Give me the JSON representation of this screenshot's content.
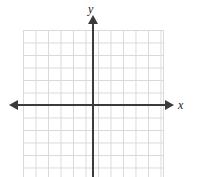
{
  "figure": {
    "title": "",
    "type": "blank-cartesian-coordinate-plane",
    "background_color": "#ffffff"
  },
  "axes": {
    "x_axis": {
      "label": "x",
      "color": "#3b3b3b",
      "arrow_left": "arrow-left",
      "arrow_right": "arrow-right"
    },
    "y_axis": {
      "label": "y",
      "color": "#3b3b3b",
      "arrow_top": "arrow-up"
    }
  },
  "grid": {
    "color": "#d9d9d9",
    "cell_size_px": 12.5,
    "columns": 11,
    "rows": 12,
    "tick_labels": []
  },
  "chart_data": {
    "type": "scatter",
    "title": "",
    "subtitle": "",
    "xlabel": "x",
    "ylabel": "y",
    "x": [],
    "y": [],
    "series": [],
    "annotations": [],
    "xlim": [
      -6,
      6
    ],
    "ylim": [
      -6,
      6
    ],
    "xticks": [
      -6,
      -5,
      -4,
      -3,
      -2,
      -1,
      0,
      1,
      2,
      3,
      4,
      5,
      6
    ],
    "yticks": [
      -6,
      -5,
      -4,
      -3,
      -2,
      -1,
      0,
      1,
      2,
      3,
      4,
      5,
      6
    ],
    "xtick_labels": [],
    "ytick_labels": [],
    "grid": true,
    "legend": null,
    "legend_position": "none"
  }
}
